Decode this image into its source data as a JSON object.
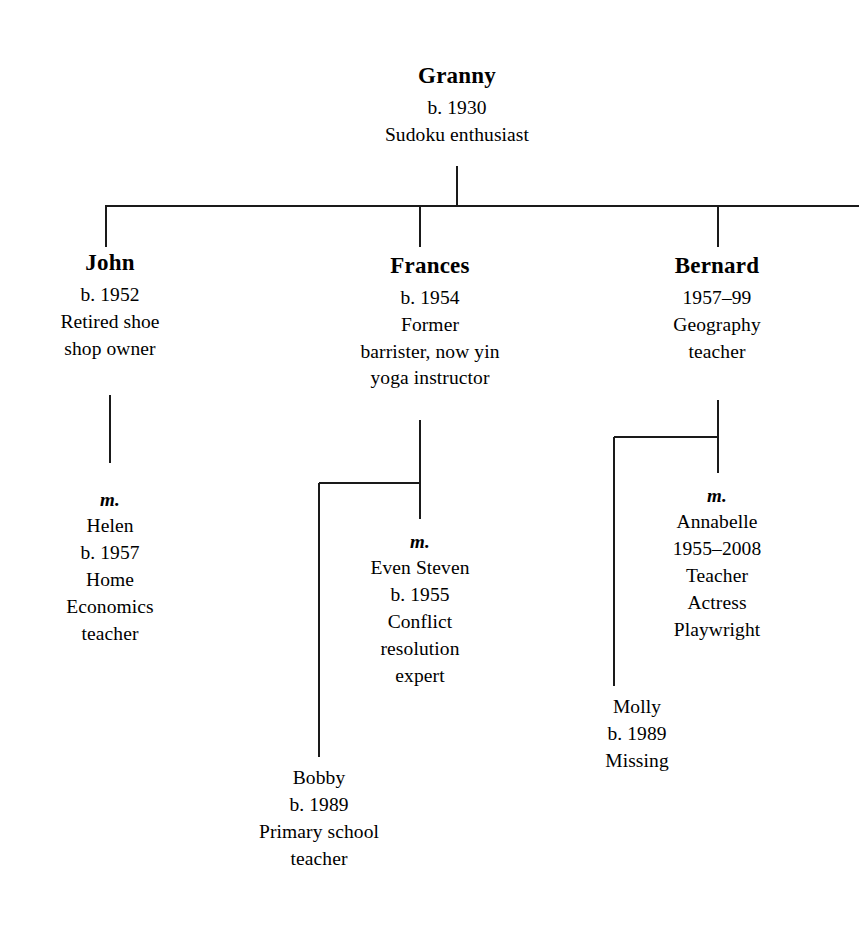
{
  "diagram": {
    "type": "family-tree",
    "line_color": "#1a1a1a",
    "background_color": "#ffffff",
    "text_color": "#000000"
  },
  "people": {
    "granny": {
      "name": "Granny",
      "lines": [
        "b. 1930",
        "Sudoku enthusiast"
      ]
    },
    "john": {
      "name": "John",
      "lines": [
        "b. 1952",
        "Retired shoe",
        "shop owner"
      ]
    },
    "frances": {
      "name": "Frances",
      "lines": [
        "b. 1954",
        "Former",
        "barrister, now yin",
        "yoga instructor"
      ]
    },
    "bernard": {
      "name": "Bernard",
      "lines": [
        "1957–99",
        "Geography",
        "teacher"
      ]
    },
    "helen": {
      "marriage_mark": "m.",
      "name": "Helen",
      "lines": [
        "b. 1957",
        "Home",
        "Economics",
        "teacher"
      ]
    },
    "even_steven": {
      "marriage_mark": "m.",
      "name": "Even Steven",
      "lines": [
        "b. 1955",
        "Conflict",
        "resolution",
        "expert"
      ]
    },
    "annabelle": {
      "marriage_mark": "m.",
      "name": "Annabelle",
      "lines": [
        "1955–2008",
        "Teacher",
        "Actress",
        "Playwright"
      ]
    },
    "bobby": {
      "name": "Bobby",
      "lines": [
        "b. 1989",
        "Primary school",
        "teacher"
      ]
    },
    "molly": {
      "name": "Molly",
      "lines": [
        "b. 1989",
        "Missing"
      ]
    }
  }
}
